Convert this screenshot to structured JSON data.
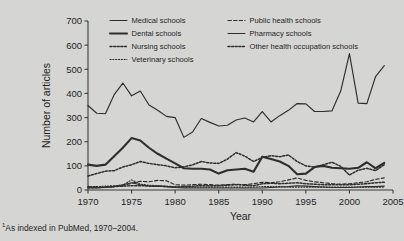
{
  "chart_data": {
    "type": "line",
    "title": "",
    "xlabel": "Year",
    "ylabel": "Number of articles",
    "xlim": [
      1970,
      2005
    ],
    "ylim": [
      0,
      700
    ],
    "xticks": [
      1970,
      1975,
      1980,
      1985,
      1990,
      1995,
      2000,
      2005
    ],
    "yticks": [
      0,
      100,
      200,
      300,
      400,
      500,
      600,
      700
    ],
    "grid": false,
    "legend_position": "top-center",
    "x": [
      1970,
      1971,
      1972,
      1973,
      1974,
      1975,
      1976,
      1977,
      1978,
      1979,
      1980,
      1981,
      1982,
      1983,
      1984,
      1985,
      1986,
      1987,
      1988,
      1989,
      1990,
      1991,
      1992,
      1993,
      1994,
      1995,
      1996,
      1997,
      1998,
      1999,
      2000,
      2001,
      2002,
      2003,
      2004
    ],
    "series": [
      {
        "name": "Medical schools",
        "style": "solid-thin",
        "values": [
          350,
          318,
          316,
          395,
          443,
          390,
          410,
          352,
          330,
          305,
          300,
          218,
          240,
          296,
          280,
          265,
          268,
          290,
          298,
          282,
          325,
          282,
          308,
          330,
          358,
          357,
          325,
          325,
          328,
          410,
          565,
          360,
          358,
          470,
          515
        ]
      },
      {
        "name": "Dental schools",
        "style": "solid-thick",
        "values": [
          105,
          100,
          105,
          140,
          175,
          215,
          205,
          175,
          150,
          130,
          110,
          90,
          88,
          88,
          85,
          68,
          82,
          85,
          88,
          76,
          138,
          128,
          118,
          100,
          65,
          68,
          95,
          100,
          92,
          90,
          88,
          92,
          115,
          90,
          112
        ]
      },
      {
        "name": "Nursing schools",
        "style": "dotted-bold",
        "values": [
          58,
          68,
          78,
          80,
          95,
          105,
          118,
          110,
          105,
          100,
          92,
          96,
          104,
          118,
          112,
          110,
          128,
          155,
          140,
          118,
          135,
          142,
          138,
          145,
          118,
          100,
          95,
          105,
          115,
          98,
          62,
          82,
          90,
          80,
          105
        ]
      },
      {
        "name": "Veterinary schools",
        "style": "dotted-fine",
        "values": [
          15,
          14,
          16,
          18,
          20,
          42,
          24,
          20,
          18,
          16,
          14,
          12,
          12,
          12,
          12,
          12,
          12,
          12,
          12,
          12,
          14,
          14,
          14,
          12,
          12,
          12,
          12,
          12,
          12,
          12,
          12,
          12,
          12,
          12,
          12
        ]
      },
      {
        "name": "Public health schools",
        "style": "dashed",
        "values": [
          14,
          12,
          12,
          14,
          18,
          28,
          36,
          34,
          40,
          38,
          22,
          20,
          22,
          24,
          22,
          20,
          22,
          24,
          22,
          26,
          32,
          30,
          34,
          42,
          50,
          40,
          34,
          30,
          26,
          24,
          26,
          30,
          34,
          44,
          50
        ]
      },
      {
        "name": "Pharmacy schools",
        "style": "solid-thin",
        "values": [
          8,
          8,
          10,
          14,
          22,
          30,
          22,
          18,
          16,
          14,
          10,
          8,
          8,
          8,
          8,
          8,
          8,
          8,
          8,
          8,
          8,
          10,
          12,
          14,
          18,
          16,
          14,
          12,
          10,
          10,
          10,
          12,
          14,
          14,
          16
        ]
      },
      {
        "name": "Other health occupation schools",
        "style": "dotted-bold",
        "values": [
          10,
          10,
          12,
          14,
          16,
          18,
          18,
          16,
          16,
          14,
          12,
          14,
          16,
          18,
          18,
          18,
          20,
          22,
          20,
          18,
          26,
          28,
          26,
          28,
          30,
          26,
          24,
          22,
          22,
          22,
          22,
          24,
          26,
          30,
          32
        ]
      }
    ]
  },
  "legend": {
    "items": [
      {
        "label": "Medical schools",
        "style": "solid-thin"
      },
      {
        "label": "Dental schools",
        "style": "solid-thick"
      },
      {
        "label": "Nursing schools",
        "style": "dotted-bold"
      },
      {
        "label": "Veterinary schools",
        "style": "dotted-fine"
      },
      {
        "label": "Public health schools",
        "style": "dashed"
      },
      {
        "label": "Pharmacy schools",
        "style": "solid-thin"
      },
      {
        "label": "Other health occupation schools",
        "style": "dotted-bold"
      }
    ]
  },
  "footnote": {
    "marker": "1",
    "text": "As indexed in PubMed, 1970–2004."
  },
  "colors": {
    "background": "#d5d5d3",
    "ink": "#2e2e2e",
    "axis": "#3b3b3b"
  }
}
